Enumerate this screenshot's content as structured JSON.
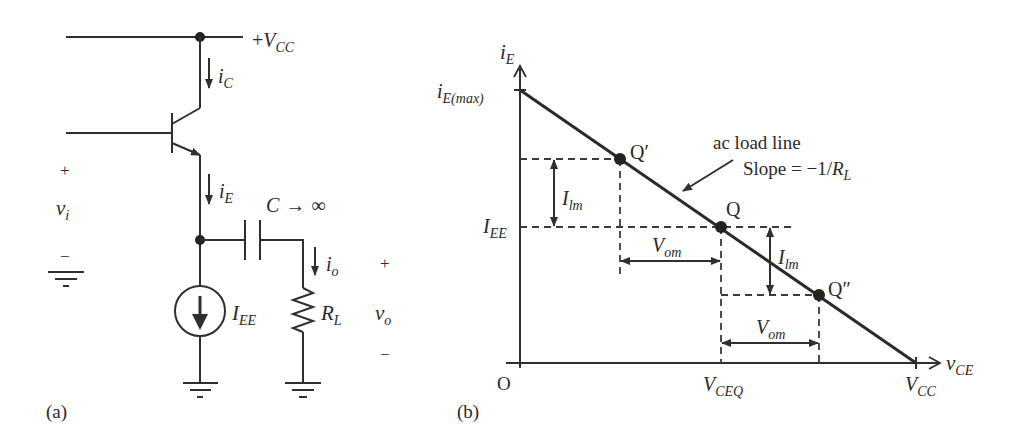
{
  "panel_a": {
    "label": "(a)",
    "supply": {
      "prefix": "+",
      "symbol": "V",
      "sub": "CC"
    },
    "collector_current": {
      "symbol": "i",
      "sub": "C"
    },
    "emitter_current": {
      "symbol": "i",
      "sub": "E"
    },
    "input": {
      "plus": "+",
      "symbol": "v",
      "sub": "i",
      "minus": "−"
    },
    "capacitor": {
      "symbol": "C",
      "rel": "→",
      "value": "∞"
    },
    "output_current": {
      "symbol": "i",
      "sub": "o"
    },
    "current_source": {
      "symbol": "I",
      "sub": "EE"
    },
    "load": {
      "symbol": "R",
      "sub": "L"
    },
    "output": {
      "plus": "+",
      "symbol": "v",
      "sub": "o",
      "minus": "−"
    }
  },
  "panel_b": {
    "label": "(b)",
    "y_axis": {
      "symbol": "i",
      "sub": "E"
    },
    "x_axis": {
      "symbol": "v",
      "sub": "CE"
    },
    "origin": "O",
    "y_max": {
      "symbol": "i",
      "sub": "E(max)"
    },
    "y_q": {
      "symbol": "I",
      "sub": "EE"
    },
    "x_q": {
      "symbol": "V",
      "sub": "CEQ"
    },
    "x_max": {
      "symbol": "V",
      "sub": "CC"
    },
    "load_line_title": "ac load line",
    "slope_text": "Slope = −1/",
    "slope_sym": {
      "symbol": "R",
      "sub": "L"
    },
    "points": {
      "q_prime": "Q′",
      "q": "Q",
      "q_double_prime": "Q″"
    },
    "ilm_1": {
      "symbol": "I",
      "sub": "lm"
    },
    "ilm_2": {
      "symbol": "I",
      "sub": "lm"
    },
    "vom_1": {
      "symbol": "V",
      "sub": "om"
    },
    "vom_2": {
      "symbol": "V",
      "sub": "om"
    }
  }
}
